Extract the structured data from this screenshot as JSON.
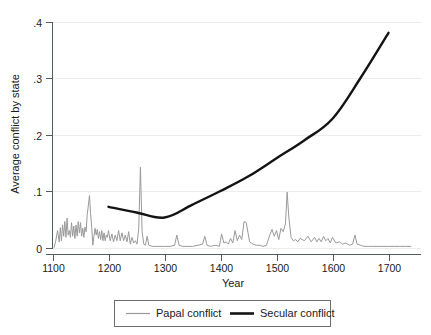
{
  "chart_data": {
    "type": "line",
    "title": "",
    "xlabel": "Year",
    "ylabel": "Average conflict by state",
    "xlim": [
      1093,
      1745
    ],
    "ylim": [
      0,
      0.42
    ],
    "xticks": [
      1100,
      1200,
      1300,
      1400,
      1500,
      1600,
      1700
    ],
    "xtick_labels": [
      "1100",
      "1200",
      "1300",
      "1400",
      "1500",
      "1600",
      "1700"
    ],
    "yticks": [
      0,
      0.1,
      0.2,
      0.3,
      0.4
    ],
    "ytick_labels": [
      "0",
      ".1",
      ".2",
      ".3",
      ".4"
    ],
    "grid": true,
    "grid_axis": "y",
    "legend_position": "below",
    "series": [
      {
        "name": "Papal conflict",
        "color": "#9a9a9a",
        "linewidth": 1,
        "x": [
          1103,
          1106,
          1109,
          1112,
          1114,
          1116,
          1118,
          1120,
          1122,
          1124,
          1126,
          1128,
          1130,
          1132,
          1134,
          1136,
          1138,
          1140,
          1142,
          1144,
          1146,
          1148,
          1150,
          1152,
          1154,
          1156,
          1158,
          1160,
          1162,
          1164,
          1166,
          1168,
          1170,
          1172,
          1174,
          1176,
          1178,
          1180,
          1182,
          1184,
          1186,
          1188,
          1190,
          1192,
          1194,
          1196,
          1198,
          1200,
          1203,
          1206,
          1209,
          1212,
          1215,
          1218,
          1221,
          1224,
          1227,
          1230,
          1233,
          1236,
          1239,
          1242,
          1245,
          1248,
          1251,
          1254,
          1257,
          1260,
          1263,
          1266,
          1269,
          1272,
          1278,
          1285,
          1292,
          1300,
          1310,
          1318,
          1322,
          1326,
          1332,
          1340,
          1350,
          1360,
          1368,
          1372,
          1376,
          1382,
          1390,
          1398,
          1402,
          1406,
          1410,
          1414,
          1418,
          1422,
          1426,
          1430,
          1434,
          1438,
          1442,
          1446,
          1452,
          1458,
          1464,
          1470,
          1476,
          1482,
          1488,
          1492,
          1496,
          1500,
          1504,
          1508,
          1512,
          1516,
          1519,
          1522,
          1526,
          1530,
          1534,
          1538,
          1542,
          1546,
          1550,
          1556,
          1562,
          1568,
          1572,
          1576,
          1580,
          1584,
          1588,
          1592,
          1596,
          1600,
          1606,
          1612,
          1618,
          1624,
          1630,
          1636,
          1640,
          1644,
          1650,
          1656,
          1664,
          1672,
          1680,
          1690,
          1700,
          1710,
          1720,
          1730,
          1740
        ],
        "y": [
          0.0,
          0.013,
          0.03,
          0.01,
          0.035,
          0.012,
          0.04,
          0.02,
          0.046,
          0.018,
          0.052,
          0.022,
          0.03,
          0.018,
          0.044,
          0.02,
          0.038,
          0.016,
          0.04,
          0.02,
          0.046,
          0.026,
          0.044,
          0.02,
          0.034,
          0.018,
          0.036,
          0.028,
          0.058,
          0.074,
          0.092,
          0.06,
          0.036,
          0.004,
          0.02,
          0.034,
          0.022,
          0.032,
          0.016,
          0.028,
          0.014,
          0.03,
          0.012,
          0.026,
          0.012,
          0.022,
          0.018,
          0.03,
          0.012,
          0.024,
          0.01,
          0.022,
          0.012,
          0.03,
          0.012,
          0.026,
          0.012,
          0.022,
          0.01,
          0.028,
          0.006,
          0.018,
          0.008,
          0.012,
          0.006,
          0.034,
          0.142,
          0.028,
          0.006,
          0.004,
          0.02,
          0.004,
          0.002,
          0.002,
          0.002,
          0.002,
          0.002,
          0.004,
          0.022,
          0.004,
          0.002,
          0.002,
          0.002,
          0.004,
          0.006,
          0.02,
          0.004,
          0.002,
          0.004,
          0.002,
          0.024,
          0.008,
          0.01,
          0.006,
          0.016,
          0.008,
          0.03,
          0.012,
          0.022,
          0.014,
          0.046,
          0.044,
          0.01,
          0.006,
          0.004,
          0.004,
          0.002,
          0.004,
          0.022,
          0.032,
          0.02,
          0.03,
          0.014,
          0.034,
          0.028,
          0.042,
          0.098,
          0.054,
          0.018,
          0.012,
          0.014,
          0.01,
          0.016,
          0.014,
          0.012,
          0.02,
          0.01,
          0.018,
          0.01,
          0.016,
          0.01,
          0.02,
          0.012,
          0.016,
          0.008,
          0.018,
          0.008,
          0.01,
          0.006,
          0.008,
          0.004,
          0.006,
          0.022,
          0.006,
          0.004,
          0.002,
          0.002,
          0.002,
          0.002,
          0.002,
          0.002,
          0.002,
          0.002,
          0.002,
          0.002
        ]
      },
      {
        "name": "Secular conflict",
        "color": "#141414",
        "linewidth": 2.4,
        "x": [
          1200,
          1250,
          1300,
          1350,
          1400,
          1450,
          1500,
          1550,
          1600,
          1650,
          1700
        ],
        "y": [
          0.072,
          0.062,
          0.053,
          0.076,
          0.1,
          0.126,
          0.158,
          0.19,
          0.228,
          0.3,
          0.38
        ]
      }
    ]
  },
  "legend": {
    "items": [
      {
        "label": "Papal conflict",
        "color": "#9a9a9a"
      },
      {
        "label": "Secular conflict",
        "color": "#141414"
      }
    ]
  },
  "axes": {
    "x_title": "Year",
    "y_title": "Average conflict by state"
  }
}
